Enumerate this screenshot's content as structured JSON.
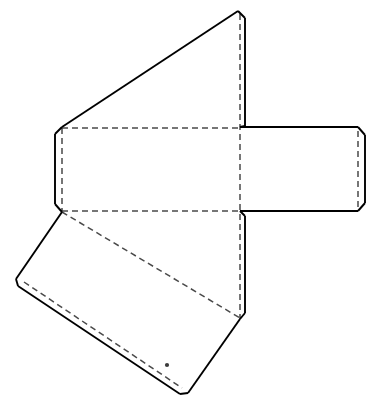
{
  "document": {
    "title": "Packaging Dieline Net",
    "kind": "line-drawing",
    "background_color": "#ffffff",
    "width": 379,
    "height": 409
  },
  "styles": {
    "cut_line_color": "#000000",
    "cut_line_width": 1.9,
    "fold_line_color": "#4a4a4a",
    "fold_line_width": 1.5,
    "fold_dash_pattern": "6 4",
    "panel_fill": "#ffffff",
    "dot_color": "#3a3a3a"
  },
  "drawing": {
    "cut_outline": "M 238 11 L 245 18 L 245 127 L 358 127 L 365 134 L 365 204 L 358 211 L 245 211 L 245 315 L 240 321 L 186 394 L 180 394 L 22 288 L 16 281 L 16 276 L 62 212 L 62 128 L 55 121 L 55 134 L 62 128 Z",
    "cut_segments": [
      {
        "name": "top-triangle-left-diagonal",
        "d": "M 238 11 L 62 127"
      },
      {
        "name": "top-triangle-apex-to-right-edge",
        "d": "M 238 11 L 245 18"
      },
      {
        "name": "top-triangle-right-vertical",
        "d": "M 245 18 L 245 126"
      },
      {
        "name": "top-flap-notch-upper",
        "d": "M 245 126 L 240 127"
      },
      {
        "name": "right-panel-top-edge",
        "d": "M 240 127 L 358 127"
      },
      {
        "name": "right-panel-top-bevel",
        "d": "M 358 127 L 365 135"
      },
      {
        "name": "right-panel-outer-edge",
        "d": "M 365 135 L 365 203"
      },
      {
        "name": "right-panel-bottom-bevel",
        "d": "M 365 203 L 358 211"
      },
      {
        "name": "right-panel-bottom-edge",
        "d": "M 358 211 L 240 211"
      },
      {
        "name": "bottom-flap-notch-upper",
        "d": "M 240 211 L 245 216"
      },
      {
        "name": "bottom-panel-right-vertical",
        "d": "M 245 216 L 245 313"
      },
      {
        "name": "bottom-panel-right-notch",
        "d": "M 245 313 L 240 319"
      },
      {
        "name": "bottom-panel-lower-right-diagonal",
        "d": "M 240 319 L 188 393"
      },
      {
        "name": "bottom-panel-bottom-vertex",
        "d": "M 188 393 L 180 394"
      },
      {
        "name": "bottom-flap-outer-diagonal",
        "d": "M 180 394 L 18 286"
      },
      {
        "name": "bottom-flap-left-bevel",
        "d": "M 18 286 L 16 279"
      },
      {
        "name": "bottom-left-panel-upper-diagonal",
        "d": "M 16 279 L 62 212"
      },
      {
        "name": "left-flap-bottom-bevel",
        "d": "M 62 212 L 55 204"
      },
      {
        "name": "left-flap-outer-edge",
        "d": "M 55 204 L 55 134"
      },
      {
        "name": "left-flap-top-bevel",
        "d": "M 55 134 L 62 127"
      }
    ],
    "fold_segments": [
      {
        "name": "fold-top-horizontal",
        "d": "M 62 128 L 240 128"
      },
      {
        "name": "fold-bottom-horizontal",
        "d": "M 62 211 L 240 211"
      },
      {
        "name": "fold-center-vertical",
        "d": "M 240 14 L 240 319"
      },
      {
        "name": "fold-left-panel-vertical",
        "d": "M 62 128 L 62 211"
      },
      {
        "name": "fold-right-panel-vertical",
        "d": "M 358 131 L 358 208"
      },
      {
        "name": "fold-bottom-panel-diagonal",
        "d": "M 62 212 L 240 318"
      },
      {
        "name": "fold-bottom-flap-parallel",
        "d": "M 24 282 L 182 388"
      }
    ],
    "markers": [
      {
        "name": "registration-dot",
        "cx": 167,
        "cy": 365,
        "r": 2.1
      }
    ]
  },
  "panels": [
    {
      "name": "top-tapered-panel",
      "points": "238,11 245,18 245,127 62,127",
      "role": "tapered top closure"
    },
    {
      "name": "center-main-panel",
      "points": "62,128 240,128 240,211 62,211",
      "role": "main rectangular face"
    },
    {
      "name": "right-side-panel",
      "points": "240,127 358,127 365,135 365,203 358,211 240,211",
      "role": "side panel with beveled glue flap"
    },
    {
      "name": "left-edge-flap",
      "points": "62,127 55,134 55,204 62,212",
      "role": "narrow left glue flap"
    },
    {
      "name": "bottom-angled-panel",
      "points": "62,212 240,211 245,216 245,313 240,319 16,279",
      "role": "lower angled panel"
    },
    {
      "name": "bottom-closure-flap",
      "points": "16,279 240,319 188,393 180,394 18,286",
      "role": "bottom closure flap"
    }
  ]
}
